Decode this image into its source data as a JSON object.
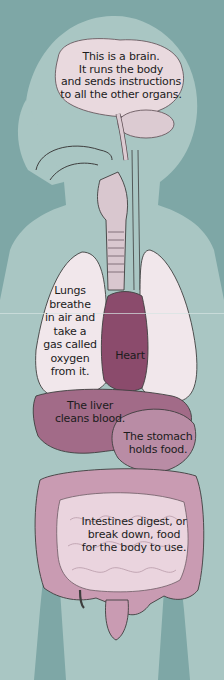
{
  "colors": {
    "background": "#7ea7a6",
    "silhouette": "#a9c6c3",
    "brain": "#e9d9de",
    "lungs": "#f1e7eb",
    "heart": "#8b4b6c",
    "liver": "#a26b88",
    "stomach": "#b98ca5",
    "intestines": "#ead4de",
    "colon": "#c99bb2",
    "windpipe": "#d9c7cf"
  },
  "labels": {
    "brain": "This is a brain.\nIt runs the body\nand sends instructions\nto all the other organs.",
    "lungs": "Lungs\nbreathe\nin air and\ntake a\ngas called\noxygen\nfrom it.",
    "heart": "Heart",
    "liver": "The liver\ncleans blood.",
    "stomach": "The stomach\nholds food.",
    "intestines": "Intestines digest, or\nbreak down, food\nfor the body to use."
  }
}
